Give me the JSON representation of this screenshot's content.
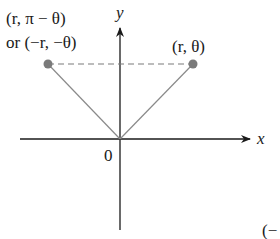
{
  "diagram": {
    "axes": {
      "x_label": "x",
      "y_label": "y",
      "origin_label": "0"
    },
    "points": [
      {
        "id": "p1",
        "label": "(r, θ)",
        "x": 193,
        "y": 64
      },
      {
        "id": "p2",
        "label_line1": "(r, π − θ)",
        "label_line2": "or (−r, −θ)",
        "x": 48,
        "y": 64
      }
    ],
    "cutoff_label": "(−",
    "colors": {
      "axis": "#1a1a1a",
      "ray": "#8a8a8a",
      "point": "#7a7a7a",
      "dashed": "#7a7a7a"
    }
  }
}
